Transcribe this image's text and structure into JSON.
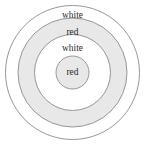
{
  "diagram": {
    "name": "concentric-circles-diagram",
    "type": "concentric-rings",
    "background_color": "#ffffff",
    "stroke_color": "#8c8c8c",
    "text_color": "#2b2b2b",
    "fill_white": "#ffffff",
    "fill_gray": "#e8e8e8",
    "center": {
      "x": 72.5,
      "y": 72.5
    },
    "rings": [
      {
        "index": 0,
        "id": "ring-outer",
        "radius": 67,
        "fill": "#ffffff",
        "label": "white",
        "label_x": 72.5,
        "label_y": 15.5
      },
      {
        "index": 1,
        "id": "ring-second",
        "radius": 54.5,
        "fill": "#e8e8e8",
        "label": "red",
        "label_x": 72.5,
        "label_y": 32
      },
      {
        "index": 2,
        "id": "ring-third",
        "radius": 38,
        "fill": "#ffffff",
        "label": "white",
        "label_x": 72.5,
        "label_y": 48
      },
      {
        "index": 3,
        "id": "ring-center",
        "radius": 16.5,
        "fill": "#e8e8e8",
        "label": "red",
        "label_x": 72.5,
        "label_y": 72.5
      }
    ]
  }
}
